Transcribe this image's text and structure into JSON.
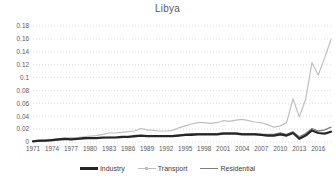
{
  "title": "Libya",
  "colors": {
    "background": "#ffffff",
    "gridline": "#d9d9d9",
    "axis_text": "#595959",
    "title_text": "#595959",
    "legend_text": "#404040"
  },
  "chart_data": {
    "type": "line",
    "title": "Libya",
    "xlabel": "",
    "ylabel": "",
    "ylim": [
      0,
      0.18
    ],
    "grid": "horizontal-dotted",
    "legend_position": "bottom",
    "y_ticks": [
      "0.18",
      "0.16",
      "0.14",
      "0.12",
      "0.1",
      "0.08",
      "0.06",
      "0.04",
      "0.02",
      "0"
    ],
    "x_tick_labels": [
      "1971",
      "1974",
      "1977",
      "1980",
      "1983",
      "1986",
      "1989",
      "1992",
      "1995",
      "1998",
      "2001",
      "2004",
      "2007",
      "2010",
      "2013",
      "2016"
    ],
    "x": [
      1971,
      1972,
      1973,
      1974,
      1975,
      1976,
      1977,
      1978,
      1979,
      1980,
      1981,
      1982,
      1983,
      1984,
      1985,
      1986,
      1987,
      1988,
      1989,
      1990,
      1991,
      1992,
      1993,
      1994,
      1995,
      1996,
      1997,
      1998,
      1999,
      2000,
      2001,
      2002,
      2003,
      2004,
      2005,
      2006,
      2007,
      2008,
      2009,
      2010,
      2011,
      2012,
      2013,
      2014,
      2015,
      2016,
      2017,
      2018
    ],
    "series": [
      {
        "name": "Industry",
        "color": "#262626",
        "stroke_width": 2.2,
        "values": [
          0.001,
          0.002,
          0.002,
          0.003,
          0.004,
          0.005,
          0.004,
          0.005,
          0.006,
          0.006,
          0.006,
          0.007,
          0.007,
          0.007,
          0.008,
          0.008,
          0.009,
          0.01,
          0.009,
          0.009,
          0.009,
          0.009,
          0.009,
          0.01,
          0.011,
          0.011,
          0.012,
          0.012,
          0.012,
          0.012,
          0.013,
          0.013,
          0.013,
          0.012,
          0.012,
          0.012,
          0.011,
          0.01,
          0.01,
          0.012,
          0.01,
          0.014,
          0.005,
          0.01,
          0.018,
          0.014,
          0.013,
          0.016
        ]
      },
      {
        "name": "Transport",
        "color": "#bfbfbf",
        "stroke_width": 1.2,
        "values": [
          0.001,
          0.002,
          0.003,
          0.004,
          0.005,
          0.006,
          0.007,
          0.007,
          0.008,
          0.009,
          0.01,
          0.012,
          0.014,
          0.014,
          0.015,
          0.016,
          0.017,
          0.021,
          0.019,
          0.018,
          0.017,
          0.017,
          0.018,
          0.022,
          0.025,
          0.028,
          0.03,
          0.03,
          0.029,
          0.03,
          0.033,
          0.032,
          0.034,
          0.035,
          0.033,
          0.031,
          0.03,
          0.027,
          0.023,
          0.025,
          0.03,
          0.067,
          0.039,
          0.066,
          0.123,
          0.104,
          0.131,
          0.159
        ]
      },
      {
        "name": "Residential",
        "color": "#7f7f7f",
        "stroke_width": 1.3,
        "values": [
          0.001,
          0.001,
          0.002,
          0.002,
          0.003,
          0.004,
          0.004,
          0.005,
          0.005,
          0.006,
          0.006,
          0.006,
          0.007,
          0.007,
          0.007,
          0.008,
          0.008,
          0.009,
          0.009,
          0.009,
          0.01,
          0.01,
          0.01,
          0.011,
          0.012,
          0.013,
          0.013,
          0.013,
          0.013,
          0.013,
          0.014,
          0.014,
          0.014,
          0.013,
          0.013,
          0.013,
          0.012,
          0.012,
          0.012,
          0.014,
          0.012,
          0.016,
          0.008,
          0.013,
          0.021,
          0.017,
          0.019,
          0.023
        ]
      }
    ]
  }
}
